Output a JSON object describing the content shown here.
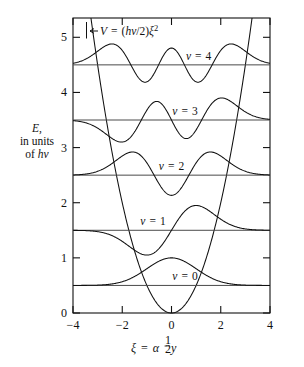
{
  "chart_data": {
    "type": "line",
    "title": "",
    "subtitle": "",
    "xlabel": "ξ = α½ y",
    "ylabel": "E, in units of hν",
    "xlim": [
      -4,
      4
    ],
    "ylim": [
      0,
      5.35
    ],
    "grid": false,
    "legend": "inline-annotations",
    "xticks": [
      -4,
      -2,
      0,
      2,
      4
    ],
    "xticklabels": [
      "−4",
      "−2",
      "0",
      "2",
      "4"
    ],
    "yticks": [
      0,
      1,
      2,
      3,
      4,
      5
    ],
    "yticklabels": [
      "0",
      "1",
      "2",
      "3",
      "4",
      "5"
    ],
    "potential": {
      "label": "V = (hν/2)ξ²",
      "formula_parts": {
        "v": "V",
        "equals": "=",
        "open": "(",
        "h": "h",
        "nu": "ν",
        "slash": "/2)",
        "xi": "ξ",
        "exponent": "2"
      },
      "arrow": "←",
      "coefficient": 0.5,
      "xi_at_top": [
        -3.27,
        3.27
      ]
    },
    "series": [
      {
        "name": "v = 0",
        "quantum_number": 0,
        "energy": 0.5,
        "nodes": 0,
        "label": "v = 0",
        "label_xi": 0.55,
        "amplitude": 0.5,
        "symmetry": "even"
      },
      {
        "name": "v = 1",
        "quantum_number": 1,
        "energy": 1.5,
        "nodes": 1,
        "label": "v = 1",
        "label_xi": -0.75,
        "amplitude": 0.45,
        "symmetry": "odd"
      },
      {
        "name": "v = 2",
        "quantum_number": 2,
        "energy": 2.5,
        "nodes": 2,
        "label": "v = 2",
        "label_xi": 0.0,
        "amplitude": 0.42,
        "symmetry": "even"
      },
      {
        "name": "v = 3",
        "quantum_number": 3,
        "energy": 3.5,
        "nodes": 3,
        "label": "v = 3",
        "label_xi": 0.55,
        "amplitude": 0.4,
        "symmetry": "odd"
      },
      {
        "name": "v = 4",
        "quantum_number": 4,
        "energy": 4.5,
        "nodes": 4,
        "label": "v = 4",
        "label_xi": 1.1,
        "amplitude": 0.38,
        "symmetry": "even"
      }
    ],
    "energy_levels": [
      0.5,
      1.5,
      2.5,
      3.5,
      4.5
    ]
  },
  "axis": {
    "ylabel_line1": "E,",
    "ylabel_line2": "in units",
    "ylabel_line3_prefix": "of ",
    "ylabel_line3_h": "h",
    "ylabel_line3_nu": "ν",
    "xlabel_xi": "ξ",
    "xlabel_eq": "=",
    "xlabel_alpha": "α",
    "xlabel_frac_num": "1",
    "xlabel_frac_den": "2",
    "xlabel_y": "y"
  },
  "colors": {
    "frame": "#111111",
    "curve": "#111111",
    "level_line": "#4a4a4a",
    "background": "#ffffff"
  }
}
